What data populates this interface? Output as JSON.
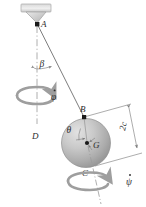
{
  "figure": {
    "type": "mechanics-diagram",
    "background_color": "#ffffff",
    "line_color": "#8a8a8a",
    "label_color": "#2b2b2b",
    "sphere_color": "#b6b6b6"
  },
  "labels": {
    "point_a": "A",
    "point_b": "B",
    "point_c": "C",
    "point_d": "D",
    "point_g": "G",
    "angle_beta": "β",
    "angle_theta": "θ",
    "spin_phi": "φ",
    "spin_psi": "ψ",
    "dimension_2c": "2c"
  },
  "elements": {
    "ceiling_support": "ceiling-plate",
    "bracket": "triangular-bracket",
    "cord": "cord-a-to-b",
    "vertical_axis": "vertical-dash-dot-axis-a-to-d",
    "sphere": "shaded-sphere",
    "spin_axis": "sphere-spin-axis-b-to-c",
    "dimension_line": "dimension-2c",
    "phi_rotation_arrow": "precession-arrow-phi-dot",
    "psi_rotation_arrow": "spin-arrow-psi-dot"
  },
  "geometry": {
    "point_a": [
      37,
      24
    ],
    "point_b": [
      84,
      117
    ],
    "point_c": [
      88,
      168
    ],
    "point_d": [
      37,
      127
    ],
    "point_g": [
      87,
      143
    ],
    "sphere_center": [
      86,
      143
    ],
    "sphere_radius": 24,
    "cord_angle_beta_deg": 27,
    "dimension_value": "2c"
  }
}
